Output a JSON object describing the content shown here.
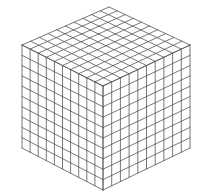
{
  "figure": {
    "description": "Base-ten thousand cube drawn as an isometric 10x10x10 grid",
    "divisions": 10,
    "line_color": "#555555",
    "background": "#ffffff",
    "vertices": {
      "top": [
        109,
        7
      ],
      "left_top": [
        22,
        45
      ],
      "right_top": [
        190,
        45
      ],
      "front_top": [
        103,
        86
      ],
      "left_bottom": [
        22,
        148
      ],
      "right_bottom": [
        190,
        148
      ],
      "front_bottom": [
        103,
        190
      ]
    },
    "faces": [
      "top",
      "left",
      "right"
    ]
  }
}
